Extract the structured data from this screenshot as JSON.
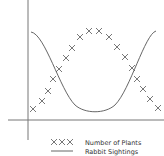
{
  "chart_data": {
    "type": "line",
    "title": "",
    "xlabel": "",
    "ylabel": "",
    "grid": false,
    "legend_position": "bottom",
    "axes_ticks": "none",
    "series": [
      {
        "name": "Number of Plants",
        "style": "markers-x",
        "color": "#555555",
        "points": [
          [
            33,
            109
          ],
          [
            42,
            101
          ],
          [
            48,
            91
          ],
          [
            53,
            79
          ],
          [
            59,
            69
          ],
          [
            66,
            58
          ],
          [
            72,
            48
          ],
          [
            80,
            37
          ],
          [
            89,
            31
          ],
          [
            99,
            31
          ],
          [
            109,
            37
          ],
          [
            117,
            47
          ],
          [
            125,
            57
          ],
          [
            132,
            68
          ],
          [
            137,
            79
          ],
          [
            143,
            89
          ],
          [
            150,
            99
          ],
          [
            158,
            108
          ]
        ]
      },
      {
        "name": "Rabbit Sightings",
        "style": "line",
        "color": "#555555",
        "shape": "U-shaped curve, high at both ends, minimum at center"
      }
    ]
  },
  "legend": {
    "plants_label": "Number of Plants",
    "plants_marker": "XXX",
    "rabbits_label": "Rabbit Sightings"
  },
  "colors": {
    "axis": "#777777",
    "series": "#555555",
    "text": "#333333"
  }
}
